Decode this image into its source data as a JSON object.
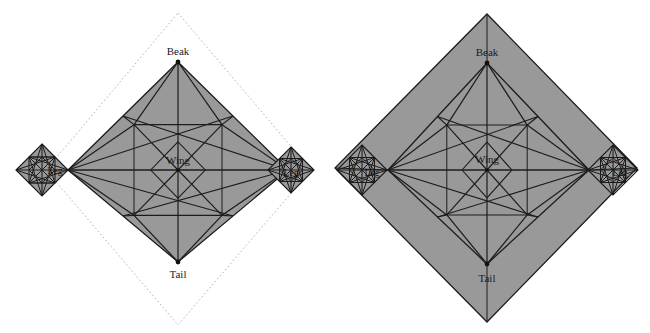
{
  "figure": {
    "panel_count": 2,
    "background_color": "#ffffff",
    "paper_fill_color": "#999999",
    "crease_line_color": "#1c1c1c",
    "dotted_line_color": "#b4b4b4",
    "vertex_dot_color": "#111111"
  },
  "labels": {
    "beak": "Beak",
    "tail": "Tail",
    "wing": "Wing",
    "leg_left": "Leg",
    "leg_right": "Leg"
  },
  "panels": [
    {
      "name": "left-panel",
      "caption": "",
      "has_dotted_square": true,
      "dotted_square": {
        "top": [
          178,
          13
        ],
        "right": [
          311,
          170
        ],
        "bottom": [
          178,
          325
        ],
        "left": [
          46,
          170
        ]
      },
      "body": {
        "beak": [
          178,
          62
        ],
        "tail": [
          178,
          262
        ],
        "center": [
          178,
          170
        ],
        "left_tip": [
          68,
          170
        ],
        "right_tip": [
          288,
          170
        ]
      },
      "legs": [
        {
          "name": "leg-left",
          "center": [
            42,
            170
          ],
          "radius": 26
        },
        {
          "name": "leg-right",
          "center": [
            291,
            170
          ],
          "radius": 23
        }
      ],
      "label_positions": {
        "beak": [
          178,
          55
        ],
        "tail": [
          178,
          278
        ],
        "wing": [
          178,
          164
        ],
        "leg_left": [
          55,
          174
        ],
        "leg_right": [
          291,
          176
        ]
      }
    },
    {
      "name": "right-panel",
      "caption": "",
      "has_dotted_square": false,
      "outer_square": {
        "top": [
          487,
          14
        ],
        "right": [
          637,
          168
        ],
        "bottom": [
          487,
          322
        ],
        "left": [
          335,
          168
        ]
      },
      "body": {
        "beak": [
          487,
          63
        ],
        "tail": [
          487,
          264
        ],
        "center": [
          487,
          170
        ],
        "left_tip": [
          388,
          170
        ],
        "right_tip": [
          589,
          170
        ]
      },
      "legs": [
        {
          "name": "leg-left",
          "center": [
            362,
            170
          ],
          "radius": 25
        },
        {
          "name": "leg-right",
          "center": [
            613,
            170
          ],
          "radius": 25
        }
      ],
      "label_positions": {
        "beak": [
          487,
          56
        ],
        "tail": [
          487,
          282
        ],
        "wing": [
          487,
          163
        ],
        "leg_left": [
          372,
          176
        ],
        "leg_right": [
          620,
          176
        ]
      }
    }
  ],
  "geometry_notes": {
    "paper_shape": "square rotated 45 degrees (diamond orientation)",
    "flap_names": [
      "Beak",
      "Wing",
      "Tail",
      "Leg",
      "Leg"
    ],
    "crease_style_solid": "mountain/valley crease lines",
    "crease_style_dotted": "original uncut square paper boundary"
  }
}
